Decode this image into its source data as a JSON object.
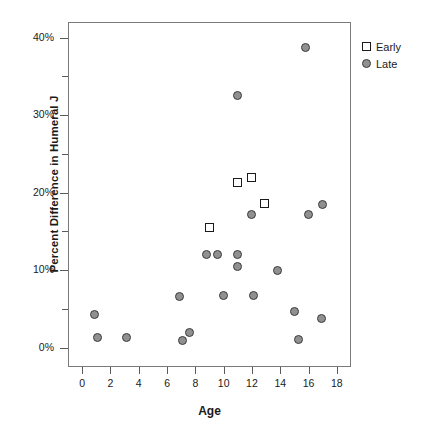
{
  "chart_data": {
    "type": "scatter",
    "title": "",
    "xlabel": "Age",
    "ylabel": "Percent Difference in Humeral J",
    "xlim": [
      -1,
      19
    ],
    "ylim": [
      -2.5,
      42
    ],
    "grid": false,
    "legend_position": "top-right",
    "x_ticks": [
      0,
      2,
      4,
      6,
      8,
      10,
      12,
      14,
      16,
      18
    ],
    "x_tick_labels": [
      "0",
      "2",
      "4",
      "6",
      "8",
      "10",
      "12",
      "14",
      "16",
      "18"
    ],
    "y_ticks": [
      0,
      5,
      10,
      15,
      20,
      25,
      30,
      35,
      40
    ],
    "y_tick_labels": [
      "0%",
      "",
      "10%",
      "",
      "20%",
      "",
      "30%",
      "",
      "40%"
    ],
    "y_major_ticks": [
      0,
      10,
      20,
      30,
      40
    ],
    "y_minor_ticks": [
      5,
      15,
      25,
      35
    ],
    "series": [
      {
        "name": "Early",
        "marker": "open-square",
        "color": "#ffffff",
        "edge_color": "#1a1a1a",
        "points": [
          {
            "x": 9.0,
            "y": 15.5
          },
          {
            "x": 11.0,
            "y": 21.3
          },
          {
            "x": 12.0,
            "y": 22.0
          },
          {
            "x": 12.9,
            "y": 18.6
          }
        ]
      },
      {
        "name": "Late",
        "marker": "filled-circle",
        "color": "#909090",
        "edge_color": "#3c3c3c",
        "points": [
          {
            "x": 0.9,
            "y": 4.3
          },
          {
            "x": 1.1,
            "y": 1.3
          },
          {
            "x": 3.1,
            "y": 1.3
          },
          {
            "x": 6.9,
            "y": 6.6
          },
          {
            "x": 7.1,
            "y": 0.9
          },
          {
            "x": 7.6,
            "y": 2.0
          },
          {
            "x": 8.8,
            "y": 12.0
          },
          {
            "x": 9.6,
            "y": 12.0
          },
          {
            "x": 10.0,
            "y": 6.7
          },
          {
            "x": 11.0,
            "y": 32.5
          },
          {
            "x": 11.0,
            "y": 12.0
          },
          {
            "x": 11.0,
            "y": 10.4
          },
          {
            "x": 12.0,
            "y": 17.2
          },
          {
            "x": 12.1,
            "y": 6.7
          },
          {
            "x": 13.8,
            "y": 9.9
          },
          {
            "x": 15.0,
            "y": 4.6
          },
          {
            "x": 15.3,
            "y": 1.0
          },
          {
            "x": 15.8,
            "y": 38.7
          },
          {
            "x": 16.0,
            "y": 17.2
          },
          {
            "x": 16.9,
            "y": 3.8
          },
          {
            "x": 17.0,
            "y": 18.5
          }
        ]
      }
    ]
  },
  "legend": {
    "entries": [
      {
        "label": "Early",
        "marker": "open-square"
      },
      {
        "label": "Late",
        "marker": "filled-circle"
      }
    ]
  }
}
